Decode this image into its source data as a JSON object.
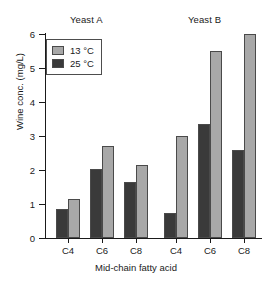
{
  "chart_data": {
    "type": "bar",
    "title": "",
    "xlabel": "Mid-chain fatty acid",
    "ylabel": "Wine conc. (mg/L)",
    "ylim": [
      0,
      6
    ],
    "ytick_labels": [
      "0",
      "1",
      "2",
      "3",
      "4",
      "5",
      "6"
    ],
    "ytick_values": [
      0,
      1,
      2,
      3,
      4,
      5,
      6
    ],
    "grid": false,
    "legend_position": "upper-left-inside",
    "categories": [
      "C4",
      "C6",
      "C8",
      "C4",
      "C6",
      "C8"
    ],
    "group_annotations": [
      {
        "label": "Yeast A",
        "categories": [
          "C4",
          "C6",
          "C8"
        ]
      },
      {
        "label": "Yeast B",
        "categories": [
          "C4",
          "C6",
          "C8"
        ]
      }
    ],
    "series": [
      {
        "name": "13 °C",
        "color": "#a8a8a8",
        "values": [
          1.15,
          2.7,
          2.15,
          3.0,
          5.5,
          6.0
        ]
      },
      {
        "name": "25 °C",
        "color": "#3a3a3a",
        "values": [
          0.85,
          2.03,
          1.65,
          0.73,
          3.35,
          2.6
        ]
      }
    ],
    "bar_order_within_group": [
      "25 °C",
      "13 °C"
    ]
  },
  "legend": {
    "items": [
      {
        "label": "13 °C",
        "color": "#a8a8a8"
      },
      {
        "label": "25 °C",
        "color": "#3a3a3a"
      }
    ]
  },
  "axes": {
    "y_title": "Wine conc. (mg/L)",
    "x_title": "Mid-chain fatty acid"
  }
}
